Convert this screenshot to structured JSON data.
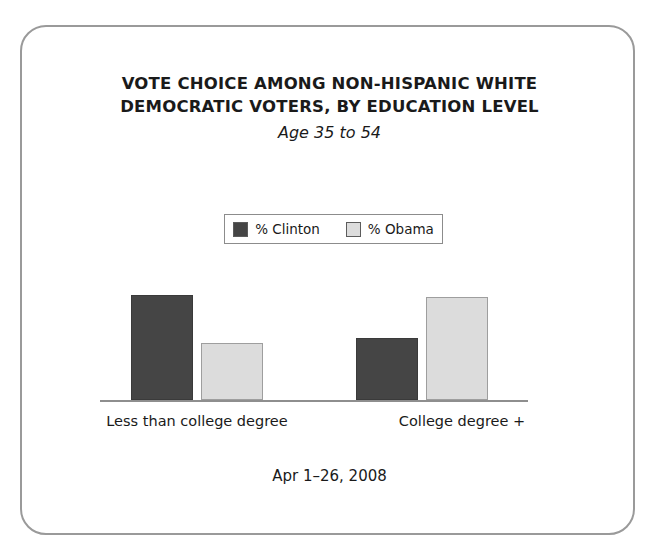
{
  "figure": {
    "title_lines": [
      "VOTE CHOICE AMONG NON-HISPANIC WHITE",
      "DEMOCRATIC VOTERS, BY EDUCATION LEVEL"
    ],
    "subtitle": "Age 35 to 54",
    "footnote": "Apr 1–26, 2008",
    "frame_border_color": "#9a9a9a",
    "background_color": "#ffffff"
  },
  "legend": {
    "entries": [
      {
        "label": "% Clinton",
        "color": "#454545"
      },
      {
        "label": "% Obama",
        "color": "#dcdcdc"
      }
    ]
  },
  "chart_data": {
    "type": "bar",
    "title": "VOTE CHOICE AMONG NON-HISPANIC WHITE DEMOCRATIC VOTERS, BY EDUCATION LEVEL",
    "subtitle": "Age 35 to 54",
    "xlabel": "",
    "ylabel": "",
    "ylim": [
      0,
      65
    ],
    "grid": false,
    "legend_position": "top-center",
    "value_labels": true,
    "categories": [
      "Less than college degree",
      "College degree +"
    ],
    "series": [
      {
        "name": "% Clinton",
        "color": "#454545",
        "values": [
          59,
          35
        ]
      },
      {
        "name": "% Obama",
        "color": "#dcdcdc",
        "values": [
          32,
          58
        ]
      }
    ],
    "annotations": [
      "Apr 1–26, 2008"
    ]
  }
}
